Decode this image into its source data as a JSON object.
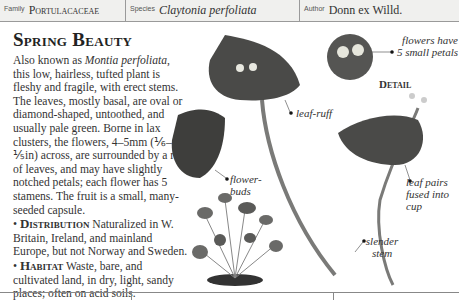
{
  "header": {
    "family_label": "Family",
    "family_value": "Portulacaceae",
    "species_label": "Species",
    "species_value": "Claytonia perfoliata",
    "author_label": "Author",
    "author_value": "Donn ex Willd."
  },
  "entry": {
    "title": "Spring Beauty",
    "intro_pre": "Also known as ",
    "intro_synonym": "Montia perfoliata",
    "intro_post": ", this low, hairless, tufted plant is fleshy and fragile, with erect stems. The leaves, mostly basal, are oval or diamond-shaped, untoothed, and usually pale green. Borne in lax clusters, the flowers, 4–5mm (⅙–⅕in) across, are surrounded by a ruff of leaves, and may have slightly notched petals; each flower has 5 stamens. The fruit is a small, many-seeded capsule.",
    "distribution_heading": "Distribution",
    "distribution_text": " Naturalized in W. Britain, Ireland, and mainland Europe, but not Norway and Sweden.",
    "habitat_heading": "Habitat",
    "habitat_text": " Waste, bare, and cultivated land, in dry, light, sandy places; often on acid soils.",
    "bullet": "•"
  },
  "annotations": {
    "flowers": "flowers have 5 small petals",
    "detail": "Detail",
    "leaf_ruff": "leaf-ruff",
    "flower_buds": "flower-buds",
    "leaf_pairs": "leaf pairs fused into cup",
    "slender_stem": "slender stem"
  },
  "colors": {
    "leaf": "#4a4a48",
    "stem": "#7a7a78",
    "header_bg": "#f0f0ee"
  }
}
